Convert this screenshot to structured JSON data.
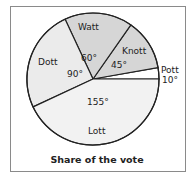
{
  "chart_data": {
    "type": "pie",
    "title": "Share of the vote",
    "unit": "degrees",
    "categories": [
      "Pott",
      "Knott",
      "Watt",
      "Dott",
      "Lott"
    ],
    "values": [
      10,
      45,
      60,
      90,
      155
    ],
    "value_labels": [
      "10°",
      "45°",
      "60°",
      "90°",
      "155°"
    ],
    "colors": [
      "#ffffff",
      "#d6d6d6",
      "#d6d6d6",
      "#ebebeb",
      "#f2f2f2"
    ],
    "start_angle_deg": 0,
    "direction": "counterclockwise",
    "legend": "none"
  },
  "labels": {
    "title": "Share of the vote",
    "pott_name": "Pott",
    "pott_value": "10°",
    "knott_name": "Knott",
    "knott_value": "45°",
    "watt_name": "Watt",
    "watt_value": "60°",
    "dott_name": "Dott",
    "dott_value": "90°",
    "lott_name": "Lott",
    "lott_value": "155°"
  }
}
